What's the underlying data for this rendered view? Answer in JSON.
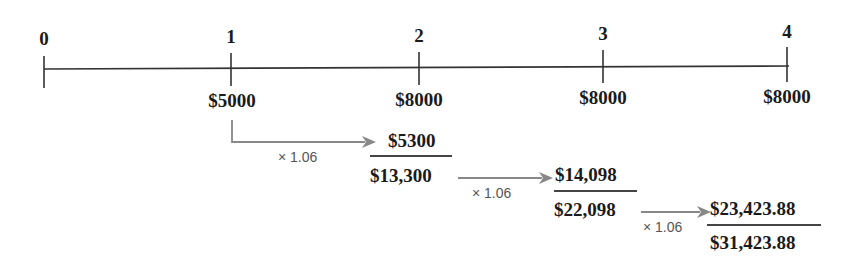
{
  "timeline": {
    "periods": [
      "0",
      "1",
      "2",
      "3",
      "4"
    ],
    "cash_flows": [
      "$5000",
      "$8000",
      "$8000",
      "$8000"
    ]
  },
  "steps": [
    {
      "multiplier": "× 1.06",
      "grown_value": "$5300",
      "cumulative": "$13,300"
    },
    {
      "multiplier": "× 1.06",
      "grown_value": "$14,098",
      "cumulative": "$22,098"
    },
    {
      "multiplier": "× 1.06",
      "grown_value": "$23,423.88",
      "cumulative": "$31,423.88"
    }
  ],
  "colors": {
    "axis": "#333333",
    "arrow": "#888888",
    "text": "#1a1a1a"
  }
}
